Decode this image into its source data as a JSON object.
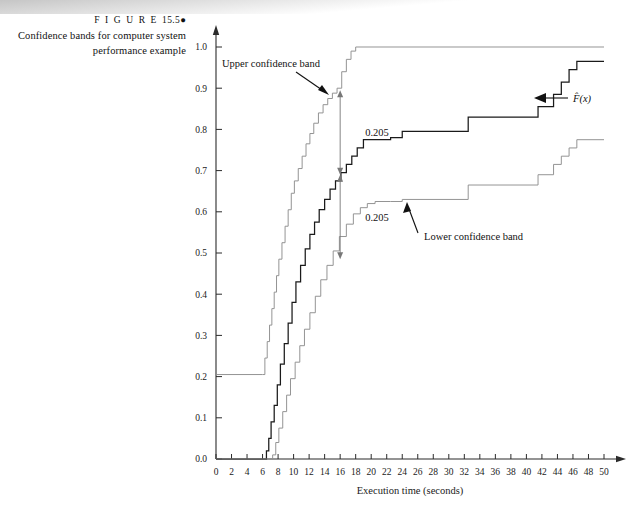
{
  "caption": {
    "figure_word": "F I G U R E",
    "figure_number": "15.5",
    "bullet": "●",
    "description": "Confidence bands for computer system performance example"
  },
  "annotations": {
    "upper_band": "Upper confidence band",
    "lower_band": "Lower confidence band",
    "ecdf": "F̂(x)",
    "gap_top": "0.205",
    "gap_bottom": "0.205"
  },
  "colors": {
    "ecdf": "#1a1a1a",
    "band": "#8e8e8e",
    "axis": "#2b2b2b",
    "arrow": "#777777",
    "background": "#ffffff"
  },
  "chart_data": {
    "type": "line",
    "title": "Confidence bands for computer system performance example",
    "xlabel": "Execution time (seconds)",
    "ylabel": "",
    "xlim": [
      0,
      50
    ],
    "ylim": [
      0.0,
      1.0
    ],
    "xticks": [
      0,
      2,
      4,
      6,
      8,
      10,
      12,
      14,
      16,
      18,
      20,
      22,
      24,
      26,
      28,
      30,
      32,
      34,
      36,
      38,
      40,
      42,
      44,
      46,
      48,
      50
    ],
    "xticklabels": [
      "0",
      "2",
      "4",
      "6",
      "8",
      "10",
      "12",
      "14",
      "16",
      "18",
      "20",
      "22",
      "24",
      "26",
      "28",
      "30",
      "32",
      "34",
      "36",
      "38",
      "40",
      "42",
      "44",
      "46",
      "48",
      "50"
    ],
    "yticks": [
      0.0,
      0.1,
      0.2,
      0.3,
      0.4,
      0.5,
      0.6,
      0.7,
      0.8,
      0.9,
      1.0
    ],
    "yticklabels": [
      "0.0",
      "0.1",
      "0.2",
      "0.3",
      "0.4",
      "0.5",
      "0.6",
      "0.7",
      "0.8",
      "0.9",
      "1.0"
    ],
    "grid": false,
    "legend": "none",
    "band_halfwidth": 0.205,
    "step_style": "post",
    "series": [
      {
        "name": "Upper confidence band",
        "color": "#8e8e8e",
        "x": [
          0,
          6.0,
          6.3,
          6.6,
          6.9,
          7.2,
          7.5,
          7.8,
          8.1,
          8.5,
          8.9,
          9.3,
          9.7,
          10.1,
          10.6,
          11.1,
          11.6,
          12.1,
          12.6,
          13.2,
          13.8,
          14.4,
          15.0,
          15.6,
          16.2,
          16.8,
          17.4,
          18.0,
          50
        ],
        "values": [
          0.205,
          0.205,
          0.245,
          0.285,
          0.325,
          0.365,
          0.405,
          0.445,
          0.485,
          0.525,
          0.565,
          0.605,
          0.645,
          0.675,
          0.705,
          0.735,
          0.765,
          0.79,
          0.815,
          0.84,
          0.86,
          0.875,
          0.888,
          0.9,
          0.94,
          0.97,
          0.99,
          1.0,
          1.0
        ]
      },
      {
        "name": "F̂(x)",
        "color": "#1a1a1a",
        "x": [
          0,
          6.2,
          6.5,
          6.8,
          7.1,
          7.5,
          7.9,
          8.3,
          8.8,
          9.3,
          9.8,
          10.3,
          10.9,
          11.5,
          12.1,
          12.7,
          13.3,
          14.0,
          14.7,
          15.4,
          16.1,
          16.8,
          17.5,
          18.2,
          19.0,
          22.5,
          24.0,
          32.5,
          41.5,
          43.5,
          44.5,
          45.5,
          46.5,
          50
        ],
        "values": [
          0.0,
          0.0,
          0.02,
          0.05,
          0.09,
          0.13,
          0.18,
          0.23,
          0.28,
          0.33,
          0.38,
          0.43,
          0.47,
          0.51,
          0.545,
          0.575,
          0.605,
          0.63,
          0.655,
          0.675,
          0.695,
          0.715,
          0.735,
          0.755,
          0.775,
          0.78,
          0.795,
          0.83,
          0.855,
          0.885,
          0.915,
          0.945,
          0.965,
          0.965
        ]
      },
      {
        "name": "Lower confidence band",
        "color": "#8e8e8e",
        "x": [
          0,
          6.9,
          7.3,
          7.7,
          8.1,
          8.6,
          9.1,
          9.6,
          10.2,
          10.8,
          11.4,
          12.1,
          12.8,
          13.5,
          14.3,
          15.1,
          15.9,
          16.8,
          17.7,
          18.6,
          19.5,
          20.5,
          22.5,
          24.0,
          32.5,
          41.5,
          43.5,
          44.5,
          45.5,
          46.5,
          50
        ],
        "values": [
          0.0,
          0.0,
          0.01,
          0.04,
          0.075,
          0.115,
          0.155,
          0.195,
          0.235,
          0.275,
          0.315,
          0.355,
          0.395,
          0.435,
          0.47,
          0.505,
          0.54,
          0.57,
          0.595,
          0.61,
          0.62,
          0.625,
          0.625,
          0.63,
          0.665,
          0.69,
          0.715,
          0.735,
          0.755,
          0.775,
          0.775
        ]
      }
    ],
    "gap_markers": [
      {
        "x": 16.0,
        "y_top": 0.895,
        "y_bottom": 0.69,
        "label": "0.205"
      },
      {
        "x": 16.0,
        "y_top": 0.69,
        "y_bottom": 0.485,
        "label": "0.205"
      }
    ]
  }
}
